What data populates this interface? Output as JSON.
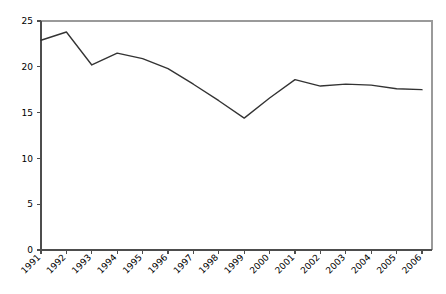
{
  "chart_data": {
    "type": "line",
    "title": "",
    "subtitle": "",
    "xlabel": "",
    "ylabel": "",
    "categories": [
      "1991",
      "1992",
      "1993",
      "1994",
      "1995",
      "1996",
      "1997",
      "1998",
      "1999",
      "2000",
      "2001",
      "2002",
      "2003",
      "2004",
      "2005",
      "2006"
    ],
    "values": [
      22.9,
      23.8,
      20.2,
      21.5,
      20.9,
      19.8,
      18.1,
      16.3,
      14.4,
      16.6,
      18.6,
      17.9,
      18.1,
      18.0,
      17.6,
      17.5
    ],
    "series": [
      {
        "name": "series-1",
        "values": [
          22.9,
          23.8,
          20.2,
          21.5,
          20.9,
          19.8,
          18.1,
          16.3,
          14.4,
          16.6,
          18.6,
          17.9,
          18.1,
          18.0,
          17.6,
          17.5
        ],
        "color": "#333333"
      }
    ],
    "ylim": [
      0,
      25
    ],
    "yticks": [
      0,
      5,
      10,
      15,
      20,
      25
    ],
    "ytick_labels": [
      "0",
      "5",
      "10",
      "15",
      "20",
      "25"
    ],
    "xtick_labels": [
      "1991",
      "1992",
      "1993",
      "1994",
      "1995",
      "1996",
      "1997",
      "1998",
      "1999",
      "2000",
      "2001",
      "2002",
      "2003",
      "2004",
      "2005",
      "2006"
    ],
    "xtick_rotation": -45,
    "grid": false,
    "legend": null,
    "legend_position": "none",
    "annotations": []
  },
  "axes": {
    "y_axis_color": "#4d4d4d",
    "x_axis_color": "#4d4d4d",
    "frame_color": "#9a9a9a"
  }
}
